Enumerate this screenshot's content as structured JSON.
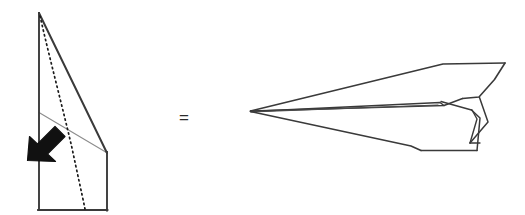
{
  "page": {
    "background_color": "#ffffff",
    "width": 525,
    "height": 215
  },
  "equality": {
    "symbol": "=",
    "label": "equals-relation",
    "color": "#2b2b2b"
  },
  "colors": {
    "outline": "#3a3a3a",
    "fold_line": "#8c8c8c",
    "dotted_line": "#1a1a1a",
    "arrow_fill": "#111111",
    "paper_fill": "#ffffff"
  },
  "left_figure": {
    "name": "folded-paper-side-view",
    "description": "Side view of partly folded paper sheet with fold crease and fold-direction arrow",
    "outline_points": "39,13 107,153 107,210 39,210",
    "left_edge": "39,13 39,210",
    "bottom_edge": "39,210 107,210",
    "right_edge": "107,153 107,210",
    "diagonal_edge": "39,13 107,153",
    "fold_crease": "39,112 107,153",
    "dotted_curve": "39,16 52,70 66,120 76,165 85,209",
    "arrow": {
      "name": "fold-direction-arrow",
      "direction": "down-left",
      "tip": "28,160",
      "tail": "63,127"
    }
  },
  "right_figure": {
    "name": "finished-paper-airplane",
    "description": "Completed paper airplane seen in three-quarter side view with swept wing and upturned tail fin",
    "nose_tip": "250,111",
    "top_wing": "250,111 442,64 505,63 495,78 462,98 444,105",
    "body_upper": "250,111 440,101 444,105",
    "body_lower": "250,111 410,146 470,143 472,136",
    "belly": "410,146 421,150 477,150 480,146",
    "fin_outer": "470,143 487,122 479,97",
    "fin_inner": "470,143 477,120 472,110",
    "tail_edge": "477,150 480,118 472,110"
  }
}
